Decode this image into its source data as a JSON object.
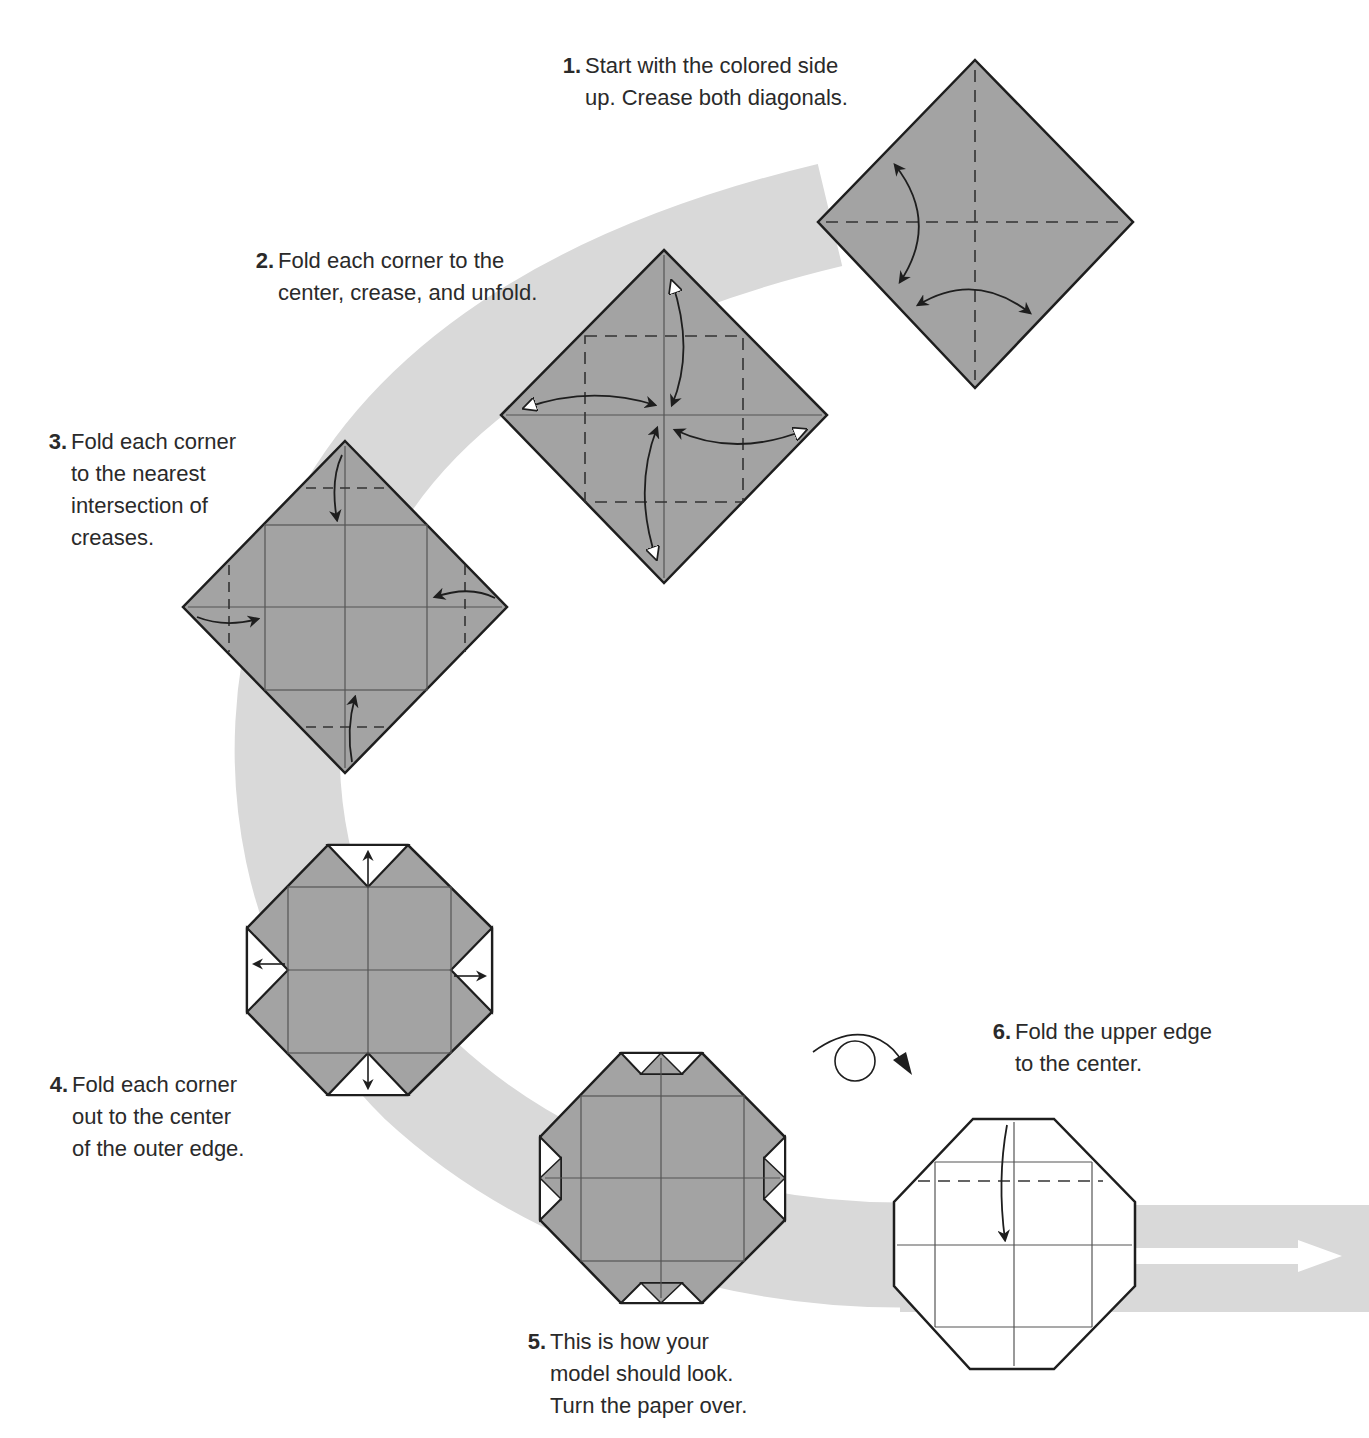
{
  "colors": {
    "paper_colored": "#a3a3a3",
    "paper_white": "#ffffff",
    "path_band": "#d9d9d9",
    "outline": "#1e1e1e",
    "crease": "#555555",
    "text": "#2a2a2a"
  },
  "steps": [
    {
      "number": "1.",
      "lines": [
        "Start with the colored side",
        "up. Crease both diagonals."
      ]
    },
    {
      "number": "2.",
      "lines": [
        "Fold each corner to the",
        "center, crease, and unfold."
      ]
    },
    {
      "number": "3.",
      "lines": [
        "Fold each corner",
        "to the nearest",
        "intersection of",
        "creases."
      ]
    },
    {
      "number": "4.",
      "lines": [
        "Fold each corner",
        "out to the center",
        "of the outer edge."
      ]
    },
    {
      "number": "5.",
      "lines": [
        "This is how your",
        "model should look.",
        "Turn the paper over."
      ]
    },
    {
      "number": "6.",
      "lines": [
        "Fold the upper edge",
        "to the center."
      ]
    }
  ],
  "symbols": {
    "turn_over": "turn-over-icon",
    "continue": "continue-arrow-icon"
  }
}
